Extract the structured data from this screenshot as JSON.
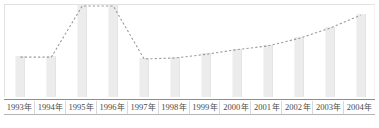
{
  "chart_data": {
    "type": "bar",
    "title": "",
    "subtitle": "",
    "xlabel": "",
    "ylabel": "",
    "grid": false,
    "legend": "none",
    "ylim": [
      0,
      100
    ],
    "categories": [
      "1993 年",
      "1994 年",
      "1995 年",
      "1996 年",
      "1997 年",
      "1998 年",
      "1999 年",
      "2000 年",
      "2001 年",
      "2002 年",
      "2003 年",
      "2004 年"
    ],
    "year_numbers": [
      "1993",
      "1994",
      "1995",
      "1996",
      "1997",
      "1998",
      "1999",
      "2000",
      "2001",
      "2002",
      "2003",
      "2004"
    ],
    "year_suffix": "年",
    "series": [
      {
        "name": "bars",
        "type": "bar",
        "values": [
          44,
          44,
          99,
          99,
          42,
          43,
          47,
          52,
          56,
          64,
          75,
          89
        ]
      },
      {
        "name": "trend",
        "type": "line",
        "style": "dashed",
        "values": [
          44,
          44,
          99,
          99,
          42,
          43,
          47,
          52,
          56,
          64,
          75,
          89
        ]
      }
    ],
    "annotations": []
  },
  "style": {
    "bar_color": "#ececec",
    "line_color": "#9a9a9a",
    "axis_color": "#8d8d8d",
    "frame_color": "#e2e2e2",
    "label_color": "#4a4a4a",
    "background": "#ffffff"
  }
}
